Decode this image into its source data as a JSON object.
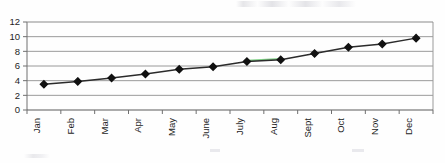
{
  "chart_data": {
    "type": "line",
    "title": "",
    "xlabel": "",
    "ylabel": "",
    "categories": [
      "Jan",
      "Feb",
      "Mar",
      "Apr",
      "May",
      "June",
      "July",
      "Aug",
      "Sept",
      "Oct",
      "Nov",
      "Dec"
    ],
    "values": [
      3.5,
      3.9,
      4.35,
      4.9,
      5.55,
      5.9,
      6.6,
      6.85,
      7.7,
      8.55,
      9.0,
      9.8
    ],
    "series": [
      {
        "name": "series-1",
        "values": [
          3.5,
          3.9,
          4.35,
          4.9,
          5.55,
          5.9,
          6.6,
          6.85,
          7.7,
          8.55,
          9.0,
          9.8
        ]
      }
    ],
    "ylim": [
      0,
      12
    ],
    "ytick_values": [
      0,
      2,
      4,
      6,
      8,
      10,
      12
    ],
    "ytick_labels": [
      "0",
      "2",
      "4",
      "6",
      "8",
      "10",
      "12"
    ],
    "grid": "horizontal",
    "legend": "none",
    "marker": "diamond",
    "line_color": "#2b2b2b",
    "marker_color": "#111111",
    "grid_color": "#8f8f8f",
    "axis_color": "#6f6f6f",
    "x_tick_label_rotation": -90,
    "annotations": [
      "faint green line segment between July and Aug",
      "faint multicolour scan artifact along the value 6 gridline from Jan to Mar"
    ]
  },
  "axes": {
    "y_labels": [
      "12",
      "10",
      "8",
      "6",
      "4",
      "2",
      "0"
    ],
    "x_labels": [
      "Jan",
      "Feb",
      "Mar",
      "Apr",
      "May",
      "June",
      "July",
      "Aug",
      "Sept",
      "Oct",
      "Nov",
      "Dec"
    ]
  }
}
